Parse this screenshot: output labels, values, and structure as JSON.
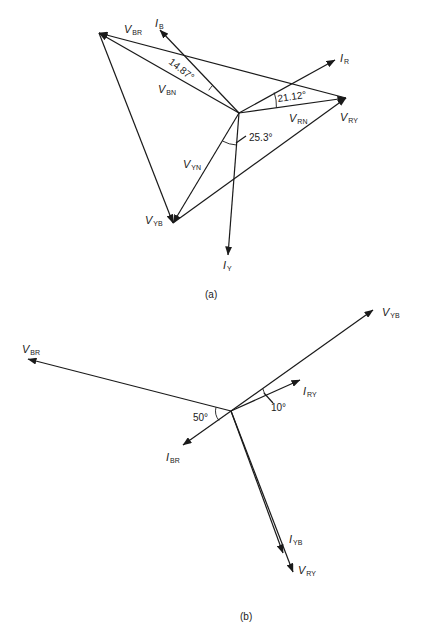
{
  "diagram_a": {
    "caption": "(a)",
    "center": [
      239,
      113
    ],
    "vertices": {
      "R": [
        346,
        98
      ],
      "Y": [
        173,
        223
      ],
      "B": [
        99,
        33
      ]
    },
    "phasors": [
      {
        "id": "V_RN",
        "main": "V",
        "sub": "RN",
        "from": [
          239,
          113
        ],
        "to": [
          346,
          98
        ],
        "label_pos": [
          289,
          122
        ]
      },
      {
        "id": "V_YN",
        "main": "V",
        "sub": "YN",
        "from": [
          239,
          113
        ],
        "to": [
          173,
          223
        ],
        "label_pos": [
          183,
          168
        ]
      },
      {
        "id": "V_BN",
        "main": "V",
        "sub": "BN",
        "from": [
          239,
          113
        ],
        "to": [
          99,
          33
        ],
        "label_pos": [
          158,
          93
        ]
      },
      {
        "id": "V_RY",
        "main": "V",
        "sub": "RY",
        "from": [
          173,
          223
        ],
        "to": [
          346,
          98
        ],
        "label_pos": [
          340,
          121
        ]
      },
      {
        "id": "V_YB",
        "main": "V",
        "sub": "YB",
        "from": [
          99,
          33
        ],
        "to": [
          173,
          223
        ],
        "label_pos": [
          145,
          224
        ]
      },
      {
        "id": "V_BR",
        "main": "V",
        "sub": "BR",
        "from": [
          346,
          98
        ],
        "to": [
          99,
          33
        ],
        "label_pos": [
          124,
          33
        ]
      },
      {
        "id": "I_R",
        "main": "I",
        "sub": "R",
        "from": [
          239,
          113
        ],
        "to": [
          335,
          60
        ],
        "label_pos": [
          340,
          62
        ]
      },
      {
        "id": "I_Y",
        "main": "I",
        "sub": "Y",
        "from": [
          239,
          113
        ],
        "to": [
          228,
          255
        ],
        "label_pos": [
          223,
          269
        ]
      },
      {
        "id": "I_B",
        "main": "I",
        "sub": "B",
        "from": [
          239,
          113
        ],
        "to": [
          160,
          30
        ],
        "label_pos": [
          155,
          27
        ]
      }
    ],
    "angles": [
      {
        "text": "14.87°",
        "pos": [
          168,
          63
        ],
        "rotate": 38
      },
      {
        "text": "21.12°",
        "pos": [
          278,
          102
        ],
        "rotate": -8
      },
      {
        "text": "25.3°",
        "pos": [
          249,
          141
        ],
        "rotate": 0
      }
    ]
  },
  "diagram_b": {
    "caption": "(b)",
    "center": [
      231,
      411
    ],
    "phasors": [
      {
        "id": "V_YB",
        "main": "V",
        "sub": "YB",
        "from": [
          231,
          411
        ],
        "to": [
          373,
          310
        ],
        "label_pos": [
          382,
          316
        ]
      },
      {
        "id": "V_BR",
        "main": "V",
        "sub": "BR",
        "from": [
          231,
          411
        ],
        "to": [
          28,
          359
        ],
        "label_pos": [
          22,
          353
        ]
      },
      {
        "id": "V_RY",
        "main": "V",
        "sub": "RY",
        "from": [
          231,
          411
        ],
        "to": [
          293,
          572
        ],
        "label_pos": [
          298,
          574
        ]
      },
      {
        "id": "I_RY",
        "main": "I",
        "sub": "RY",
        "from": [
          231,
          411
        ],
        "to": [
          300,
          380
        ],
        "label_pos": [
          303,
          395
        ]
      },
      {
        "id": "I_BR",
        "main": "I",
        "sub": "BR",
        "from": [
          231,
          411
        ],
        "to": [
          183,
          445
        ],
        "label_pos": [
          166,
          461
        ]
      },
      {
        "id": "I_YB",
        "main": "I",
        "sub": "YB",
        "from": [
          231,
          411
        ],
        "to": [
          283,
          553
        ],
        "label_pos": [
          289,
          543
        ]
      }
    ],
    "angles": [
      {
        "text": "50°",
        "pos": [
          193,
          421
        ]
      },
      {
        "text": "10°",
        "pos": [
          271,
          411
        ]
      }
    ]
  }
}
